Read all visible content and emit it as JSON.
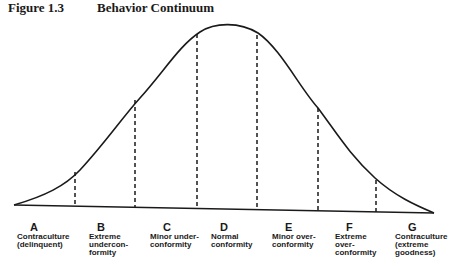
{
  "figure": {
    "number": "Figure 1.3",
    "title": "Behavior Continuum"
  },
  "diagram": {
    "type": "bell-curve",
    "line_color": "#1a1a1a",
    "divisions": 6,
    "categories": [
      {
        "letter": "A",
        "label": "Contraculture\n(delinquent)"
      },
      {
        "letter": "B",
        "label": "Extreme\nundercon-\nformity"
      },
      {
        "letter": "C",
        "label": "Minor under-\nconformity"
      },
      {
        "letter": "D",
        "label": "Normal\nconformity"
      },
      {
        "letter": "E",
        "label": "Minor over-\nconformity"
      },
      {
        "letter": "F",
        "label": "Extreme\nover-\nconformity"
      },
      {
        "letter": "G",
        "label": "Contraculture\n(extreme\ngoodness)"
      }
    ]
  }
}
